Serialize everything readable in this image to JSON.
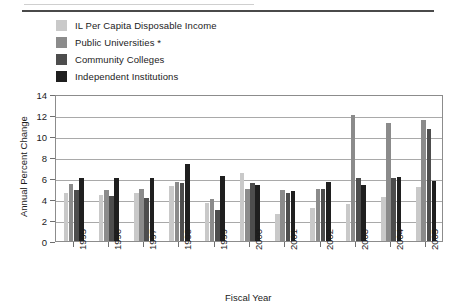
{
  "figure": {
    "top_rule": "horizontal-rule"
  },
  "chart_data": {
    "type": "bar",
    "title": "",
    "xlabel": "Fiscal Year",
    "ylabel": "Annual Percent Change",
    "ylim": [
      0,
      14
    ],
    "ytick_step": 2,
    "yticks": [
      0,
      2,
      4,
      6,
      8,
      10,
      12,
      14
    ],
    "grid": true,
    "legend_position": "above-plot-left",
    "categories": [
      "1995",
      "1996",
      "1997",
      "1998",
      "1999",
      "2000",
      "2001",
      "2002",
      "2003",
      "2004",
      "2005"
    ],
    "series": [
      {
        "name": "IL Per Capita Disposable Income",
        "color": "#c9c9c9",
        "values": [
          4.6,
          4.4,
          4.6,
          5.2,
          3.6,
          6.5,
          2.6,
          3.1,
          3.5,
          4.2,
          5.1
        ]
      },
      {
        "name": "Public Universities *",
        "color": "#8b8b8b",
        "values": [
          5.4,
          4.9,
          5.0,
          5.6,
          4.0,
          5.0,
          4.9,
          5.0,
          12.0,
          11.2,
          11.5
        ]
      },
      {
        "name": "Community Colleges",
        "color": "#4d4d4d",
        "values": [
          4.9,
          4.3,
          4.1,
          5.5,
          3.0,
          5.5,
          4.6,
          5.0,
          6.0,
          6.0,
          10.7
        ]
      },
      {
        "name": "Independent Institutions",
        "color": "#1f1f1f",
        "values": [
          6.0,
          6.0,
          6.0,
          7.3,
          6.2,
          5.3,
          4.8,
          5.6,
          5.3,
          6.1,
          5.7
        ]
      }
    ]
  }
}
